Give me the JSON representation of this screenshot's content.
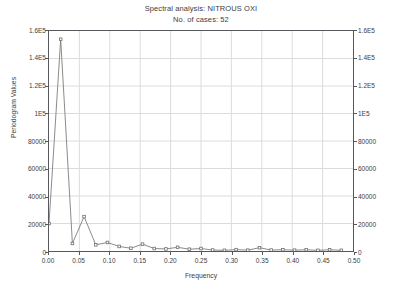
{
  "chart_data": {
    "type": "line",
    "title": "Spectral analysis: NITROUS OXI",
    "subtitle": "No. of cases: 52",
    "xlabel": "Frequency",
    "ylabel": "Periodogram Values",
    "xlim": [
      0.0,
      0.5
    ],
    "ylim": [
      0,
      160000
    ],
    "grid": true,
    "legend": null,
    "marker": "open-square",
    "line_color": "#7d7d7d",
    "marker_color": "#6e6e6e",
    "x_ticks": [
      "0.00",
      "0.05",
      "0.10",
      "0.15",
      "0.20",
      "0.25",
      "0.30",
      "0.35",
      "0.40",
      "0.45",
      "0.50"
    ],
    "x_tick_values": [
      0.0,
      0.05,
      0.1,
      0.15,
      0.2,
      0.25,
      0.3,
      0.35,
      0.4,
      0.45,
      0.5
    ],
    "y_ticks": [
      "0",
      "20000",
      "40000",
      "60000",
      "80000",
      "1E5",
      "1.2E5",
      "1.4E5",
      "1.6E5"
    ],
    "y_tick_values": [
      0,
      20000,
      40000,
      60000,
      80000,
      100000,
      120000,
      140000,
      160000
    ],
    "y_ticks_right": [
      "0",
      "20000",
      "40000",
      "60000",
      "80000",
      "1E5",
      "1.2E5",
      "1.4E5",
      "1.6E5"
    ],
    "x": [
      0.0,
      0.0192,
      0.0385,
      0.0577,
      0.0769,
      0.0962,
      0.1154,
      0.1346,
      0.1538,
      0.1731,
      0.1923,
      0.2115,
      0.2308,
      0.25,
      0.2692,
      0.2885,
      0.3077,
      0.3269,
      0.3462,
      0.3654,
      0.3846,
      0.4038,
      0.4231,
      0.4423,
      0.4615,
      0.4808
    ],
    "values": [
      20000,
      154000,
      5500,
      25000,
      4500,
      6200,
      3300,
      2000,
      5000,
      1800,
      1500,
      2700,
      1300,
      1800,
      700,
      500,
      1000,
      600,
      2400,
      700,
      900,
      600,
      900,
      500,
      900,
      500
    ],
    "series": [
      {
        "name": "Periodogram",
        "values": [
          20000,
          154000,
          5500,
          25000,
          4500,
          6200,
          3300,
          2000,
          5000,
          1800,
          1500,
          2700,
          1300,
          1800,
          700,
          500,
          1000,
          600,
          2400,
          700,
          900,
          600,
          900,
          500,
          900,
          500
        ]
      }
    ]
  }
}
